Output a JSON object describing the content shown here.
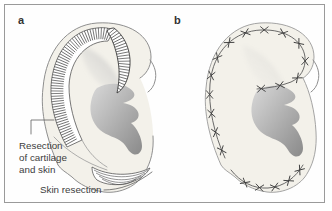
{
  "panel_a": {
    "label": "a",
    "resection_callout": [
      "Resection",
      "of cartilage",
      "and skin"
    ],
    "skin_callout": "Skin resection"
  },
  "panel_b": {
    "label": "b"
  },
  "style": {
    "frame_color": "#9a9a9a",
    "skin_tone": "#f3f1ea",
    "outline_color": "#8f8f8f",
    "hatch_color": "#4a4a4a",
    "suture_color": "#3f3f3f",
    "text_color": "#3d3d3d",
    "shadow_light": "#d9d9d9",
    "shadow_dark": "#8a8a8a",
    "leader_color": "#5f5f5f"
  }
}
